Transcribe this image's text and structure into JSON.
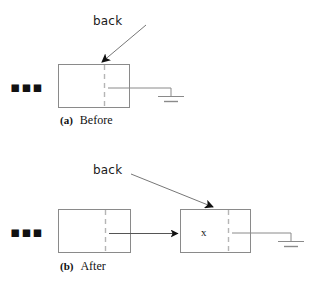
{
  "figure": {
    "stroke_color": "#7a7a7a",
    "dash_color": "#b0b0b0",
    "arrow_color": "#555555",
    "text_color": "#1a1a1a"
  },
  "panels": [
    {
      "id": "before",
      "caption_tag": "(a)",
      "caption_text": "Before",
      "ellipsis": "▪▪▪",
      "pointer_label": "back",
      "nodes": [
        {
          "id": "node-a1",
          "value": ""
        }
      ],
      "terminator": "ground"
    },
    {
      "id": "after",
      "caption_tag": "(b)",
      "caption_text": "After",
      "ellipsis": "▪▪▪",
      "pointer_label": "back",
      "nodes": [
        {
          "id": "node-b1",
          "value": ""
        },
        {
          "id": "node-b2",
          "value": "x"
        }
      ],
      "terminator": "ground"
    }
  ]
}
